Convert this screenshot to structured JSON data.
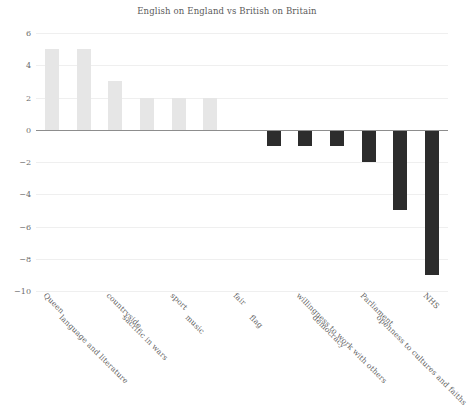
{
  "chart_data": {
    "type": "bar",
    "title": "English on England vs British on Britain",
    "xlabel": "",
    "ylabel": "",
    "ylim": [
      -10,
      6
    ],
    "yticks": [
      6,
      4,
      2,
      0,
      -2,
      -4,
      -6,
      -8,
      -10
    ],
    "ytick_labels": [
      "6",
      "4",
      "2",
      "0",
      "−2",
      "−4",
      "−6",
      "−8",
      "−10"
    ],
    "grid": true,
    "legend": "none",
    "categories": [
      "Queen",
      "language and literature",
      "countryside",
      "sacrific in wars",
      "sport",
      "music",
      "fair",
      "flag",
      "willingness to work with others",
      "democracy",
      "Parliament",
      "openness to cultures and faiths",
      "NHS"
    ],
    "values": [
      5,
      5,
      3,
      2,
      2,
      2,
      0,
      -1,
      -1,
      -1,
      -2,
      -5,
      -9
    ],
    "positive_color": "#e6e6e6",
    "negative_color": "#2c2c2c",
    "gridline_color": "#efefef",
    "zero_line_color": "#8d8d8d",
    "text_color": "#5f5f5f",
    "background_color": "#ffffff"
  }
}
